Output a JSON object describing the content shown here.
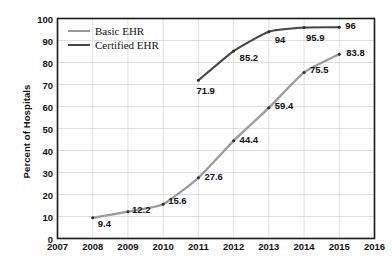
{
  "chart_data": {
    "type": "line",
    "title": "",
    "xlabel": "",
    "ylabel": "Percent of Hospitals",
    "xlim": [
      2007,
      2016
    ],
    "ylim": [
      0,
      100
    ],
    "x_ticks": [
      "2007",
      "2008",
      "2009",
      "2010",
      "2011",
      "2012",
      "2013",
      "2014",
      "2015",
      "2016"
    ],
    "y_ticks": [
      "0",
      "10",
      "20",
      "30",
      "40",
      "50",
      "60",
      "70",
      "80",
      "90",
      "100"
    ],
    "grid": true,
    "legend_position": "top-left-inside",
    "series": [
      {
        "name": "Basic EHR",
        "color": "#9b9b9b",
        "x": [
          2008,
          2009,
          2010,
          2011,
          2012,
          2013,
          2014,
          2015
        ],
        "values": [
          9.4,
          12.2,
          15.6,
          27.6,
          44.4,
          59.4,
          75.5,
          83.8
        ],
        "labels": [
          "9.4",
          "12.2",
          "15.6",
          "27.6",
          "44.4",
          "59.4",
          "75.5",
          "83.8"
        ]
      },
      {
        "name": "Certified EHR",
        "color": "#464646",
        "x": [
          2011,
          2012,
          2013,
          2014,
          2015
        ],
        "values": [
          71.9,
          85.2,
          94,
          95.9,
          96
        ],
        "labels": [
          "71.9",
          "85.2",
          "94",
          "95.9",
          "96"
        ]
      }
    ]
  },
  "legend": {
    "items": [
      {
        "label": "Basic EHR",
        "color": "#9b9b9b"
      },
      {
        "label": "Certified EHR",
        "color": "#464646"
      }
    ]
  },
  "axes": {
    "y_title": "Percent of Hospitals"
  },
  "colors": {
    "basic_ehr": "#9b9b9b",
    "certified_ehr": "#464646",
    "grid": "#d7d7d7",
    "frame": "#1a1a1a",
    "text": "#111111"
  }
}
